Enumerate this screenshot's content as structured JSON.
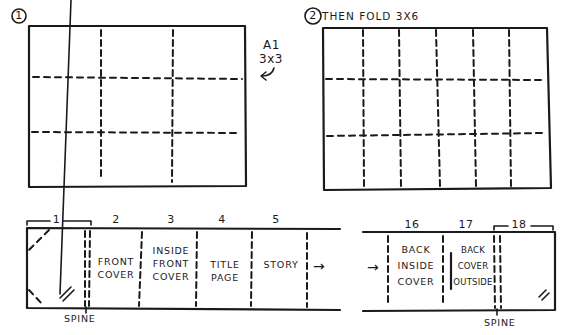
{
  "step1": {
    "number": "1",
    "size_label": "A1",
    "fold_label": "3x3",
    "grid": {
      "rows": 3,
      "cols": 3
    }
  },
  "step2": {
    "number": "2",
    "title": "THEN FOLD 3X6",
    "grid": {
      "rows": 3,
      "cols": 6
    }
  },
  "strip_left": {
    "panels": [
      {
        "number": "1",
        "text": ""
      },
      {
        "number": "2",
        "text_line1": "FRONT",
        "text_line2": "COVER"
      },
      {
        "number": "3",
        "text_line1": "INSIDE",
        "text_line2": "FRONT",
        "text_line3": "COVER"
      },
      {
        "number": "4",
        "text_line1": "TITLE",
        "text_line2": "PAGE"
      },
      {
        "number": "5",
        "text_line1": "STORY"
      }
    ],
    "spine_label": "SPINE",
    "continue_arrow": "→"
  },
  "strip_right": {
    "continue_arrow": "→",
    "panels": [
      {
        "number": "16",
        "text_line1": "BACK",
        "text_line2": "INSIDE",
        "text_line3": "COVER"
      },
      {
        "number": "17",
        "text_line1": "BACK",
        "text_line2": "COVER",
        "text_line3": "OUTSIDE"
      },
      {
        "number": "18",
        "text": ""
      }
    ],
    "spine_label": "SPINE"
  },
  "colors": {
    "ink": "#1a1a1a",
    "background": "#ffffff"
  }
}
